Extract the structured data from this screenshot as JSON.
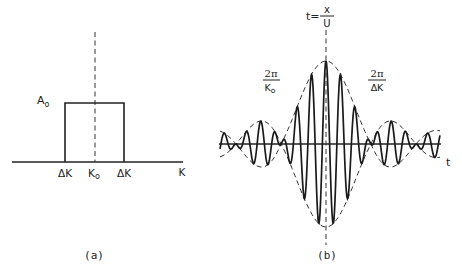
{
  "panel_a": {
    "caption": "(a)",
    "amplitude_label": "A",
    "amplitude_sub": "o",
    "tick_left": "ΔK",
    "tick_center": "K",
    "tick_center_sub": "o",
    "tick_right": "ΔK",
    "axis_label": "K"
  },
  "panel_b": {
    "caption": "(b)",
    "top_label_lhs": "t=",
    "top_label_num": "x",
    "top_label_den": "U",
    "left_label_num": "2π",
    "left_label_den": "K",
    "left_label_den_sub": "o",
    "right_label_num": "2π",
    "right_label_den": "ΔK",
    "axis_label": "t"
  },
  "chart_data": [
    {
      "type": "diagram",
      "title": "(a) Rectangular wavenumber spectrum",
      "x_axis_label": "K",
      "tick_labels": [
        "ΔK",
        "K₀",
        "ΔK"
      ],
      "amplitude": "A₀",
      "shape": "rectangle centered at K₀ with height A₀"
    },
    {
      "type": "diagram",
      "title": "(b) Wave packet in time",
      "x_axis_label": "t",
      "annotations": [
        "t = x/U",
        "2π/K₀",
        "2π/ΔK"
      ],
      "shape": "carrier oscillation modulated by sinc-like envelope (dashed), main lobe centered at t = x/U with smaller side lobes"
    }
  ]
}
